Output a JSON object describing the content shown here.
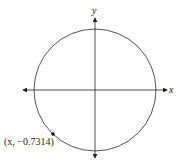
{
  "diagram": {
    "type": "unit-circle",
    "axes": {
      "x_label": "x",
      "y_label": "y"
    },
    "point": {
      "label": "(x, −0.7314)",
      "x_text": "x",
      "y_value": "−0.7314"
    },
    "colors": {
      "circle": "#555555",
      "axis": "#222222",
      "point": "#111111"
    }
  }
}
